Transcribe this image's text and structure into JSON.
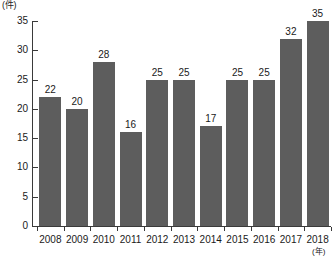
{
  "chart_data": {
    "type": "bar",
    "title": "",
    "subtitle": "",
    "xlabel": "(年)",
    "ylabel": "(件)",
    "categories": [
      "2008",
      "2009",
      "2010",
      "2011",
      "2012",
      "2013",
      "2014",
      "2015",
      "2016",
      "2017",
      "2018"
    ],
    "values": [
      22,
      20,
      28,
      16,
      25,
      25,
      17,
      25,
      25,
      32,
      35
    ],
    "series": [
      {
        "name": "件数",
        "values": [
          22,
          20,
          28,
          16,
          25,
          25,
          17,
          25,
          25,
          32,
          35
        ]
      }
    ],
    "ylim": [
      0,
      35
    ],
    "yticks": [
      0,
      5,
      10,
      15,
      20,
      25,
      30,
      35
    ],
    "ytick_labels": [
      "0",
      "5",
      "10",
      "15",
      "20",
      "25",
      "30",
      "35"
    ],
    "grid": false,
    "legend": false,
    "legend_position": "none",
    "data_labels": [
      "22",
      "20",
      "28",
      "16",
      "25",
      "25",
      "17",
      "25",
      "25",
      "32",
      "35"
    ],
    "bar_color": "#5d5d5d",
    "axis_color": "#3a3a3a",
    "background_color": "#ffffff"
  },
  "axis": {
    "y_unit": "(件)",
    "x_unit": "(年)"
  }
}
